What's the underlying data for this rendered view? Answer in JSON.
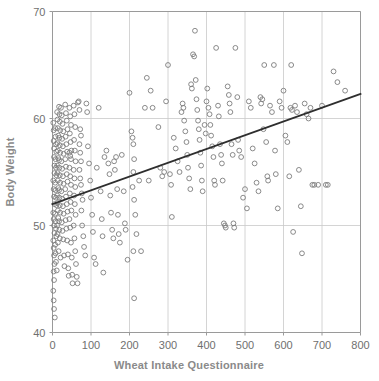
{
  "chart_data": {
    "type": "scatter",
    "title": "",
    "xlabel": "Wheat Intake Questionnaire",
    "ylabel": "Body Weight",
    "xlim": [
      0,
      800
    ],
    "ylim": [
      40,
      70
    ],
    "xticks": [
      0,
      100,
      200,
      300,
      400,
      500,
      600,
      700,
      800
    ],
    "yticks": [
      40,
      50,
      60,
      70
    ],
    "xtick_labels": [
      "0",
      "100",
      "200",
      "300",
      "400",
      "500",
      "600",
      "700",
      "800"
    ],
    "ytick_labels": [
      "40",
      "50",
      "60",
      "70"
    ],
    "grid": true,
    "legend": null,
    "marker": "open-circle",
    "marker_color": "#7d7d7d",
    "trendline": {
      "type": "linear",
      "color": "#2e2e2e",
      "x": [
        0,
        800
      ],
      "y": [
        52.0,
        62.3
      ]
    },
    "points": [
      [
        2,
        59.6
      ],
      [
        3,
        58.9
      ],
      [
        3,
        57.9
      ],
      [
        4,
        57.2
      ],
      [
        4,
        56.4
      ],
      [
        5,
        55.6
      ],
      [
        5,
        54.9
      ],
      [
        2,
        54.2
      ],
      [
        3,
        53.4
      ],
      [
        4,
        52.7
      ],
      [
        5,
        52.0
      ],
      [
        2,
        51.2
      ],
      [
        3,
        50.6
      ],
      [
        4,
        50.0
      ],
      [
        5,
        49.3
      ],
      [
        2,
        48.6
      ],
      [
        3,
        47.9
      ],
      [
        4,
        47.2
      ],
      [
        5,
        46.4
      ],
      [
        3,
        45.7
      ],
      [
        4,
        44.9
      ],
      [
        2,
        43.9
      ],
      [
        3,
        43.0
      ],
      [
        4,
        42.2
      ],
      [
        6,
        41.4
      ],
      [
        7,
        59.1
      ],
      [
        8,
        58.3
      ],
      [
        9,
        57.6
      ],
      [
        10,
        56.9
      ],
      [
        8,
        56.2
      ],
      [
        9,
        55.4
      ],
      [
        10,
        54.7
      ],
      [
        7,
        54.0
      ],
      [
        8,
        53.3
      ],
      [
        9,
        52.6
      ],
      [
        10,
        51.9
      ],
      [
        7,
        51.1
      ],
      [
        8,
        50.4
      ],
      [
        9,
        49.7
      ],
      [
        10,
        49.0
      ],
      [
        7,
        48.2
      ],
      [
        8,
        47.4
      ],
      [
        9,
        46.6
      ],
      [
        11,
        45.8
      ],
      [
        12,
        60.6
      ],
      [
        13,
        59.9
      ],
      [
        14,
        59.1
      ],
      [
        15,
        58.4
      ],
      [
        13,
        57.7
      ],
      [
        14,
        57.0
      ],
      [
        15,
        56.3
      ],
      [
        12,
        55.6
      ],
      [
        13,
        54.9
      ],
      [
        14,
        54.2
      ],
      [
        15,
        53.5
      ],
      [
        12,
        52.8
      ],
      [
        13,
        52.1
      ],
      [
        14,
        51.4
      ],
      [
        15,
        50.7
      ],
      [
        12,
        50.0
      ],
      [
        13,
        49.2
      ],
      [
        14,
        48.4
      ],
      [
        16,
        47.6
      ],
      [
        17,
        61.1
      ],
      [
        18,
        60.4
      ],
      [
        19,
        59.7
      ],
      [
        20,
        58.9
      ],
      [
        18,
        58.2
      ],
      [
        19,
        57.5
      ],
      [
        20,
        56.8
      ],
      [
        17,
        56.1
      ],
      [
        18,
        55.4
      ],
      [
        19,
        54.7
      ],
      [
        20,
        54.0
      ],
      [
        17,
        53.3
      ],
      [
        18,
        52.6
      ],
      [
        19,
        51.9
      ],
      [
        20,
        51.2
      ],
      [
        17,
        50.4
      ],
      [
        18,
        49.6
      ],
      [
        19,
        48.8
      ],
      [
        21,
        47.0
      ],
      [
        22,
        61.0
      ],
      [
        24,
        60.3
      ],
      [
        26,
        59.5
      ],
      [
        28,
        58.8
      ],
      [
        25,
        58.1
      ],
      [
        27,
        57.4
      ],
      [
        29,
        56.7
      ],
      [
        23,
        56.0
      ],
      [
        25,
        55.3
      ],
      [
        27,
        54.6
      ],
      [
        29,
        53.9
      ],
      [
        23,
        53.2
      ],
      [
        25,
        52.5
      ],
      [
        27,
        51.8
      ],
      [
        29,
        51.1
      ],
      [
        24,
        50.3
      ],
      [
        26,
        49.5
      ],
      [
        28,
        48.7
      ],
      [
        30,
        47.2
      ],
      [
        31,
        46.2
      ],
      [
        33,
        61.3
      ],
      [
        35,
        60.5
      ],
      [
        37,
        59.8
      ],
      [
        39,
        59.0
      ],
      [
        34,
        58.3
      ],
      [
        36,
        57.6
      ],
      [
        38,
        56.9
      ],
      [
        33,
        56.2
      ],
      [
        35,
        55.5
      ],
      [
        37,
        54.8
      ],
      [
        39,
        54.1
      ],
      [
        33,
        53.4
      ],
      [
        35,
        52.7
      ],
      [
        37,
        52.0
      ],
      [
        39,
        51.3
      ],
      [
        34,
        50.5
      ],
      [
        36,
        49.7
      ],
      [
        38,
        48.6
      ],
      [
        40,
        47.3
      ],
      [
        41,
        46.0
      ],
      [
        42,
        45.3
      ],
      [
        44,
        61.0
      ],
      [
        46,
        60.2
      ],
      [
        48,
        59.4
      ],
      [
        45,
        58.6
      ],
      [
        47,
        57.8
      ],
      [
        49,
        57.0
      ],
      [
        44,
        56.8
      ],
      [
        46,
        56.5
      ],
      [
        48,
        56.2
      ],
      [
        44,
        55.4
      ],
      [
        46,
        54.6
      ],
      [
        48,
        53.8
      ],
      [
        45,
        53.0
      ],
      [
        47,
        52.2
      ],
      [
        49,
        51.4
      ],
      [
        44,
        50.6
      ],
      [
        46,
        49.8
      ],
      [
        48,
        48.4
      ],
      [
        50,
        47.0
      ],
      [
        51,
        45.4
      ],
      [
        52,
        44.6
      ],
      [
        55,
        61.2
      ],
      [
        57,
        60.4
      ],
      [
        59,
        59.2
      ],
      [
        56,
        58.0
      ],
      [
        58,
        57.0
      ],
      [
        60,
        56.0
      ],
      [
        55,
        55.2
      ],
      [
        57,
        54.4
      ],
      [
        59,
        53.6
      ],
      [
        56,
        52.8
      ],
      [
        58,
        52.0
      ],
      [
        60,
        51.0
      ],
      [
        55,
        50.0
      ],
      [
        57,
        48.8
      ],
      [
        59,
        47.6
      ],
      [
        61,
        46.4
      ],
      [
        63,
        45.2
      ],
      [
        65,
        44.6
      ],
      [
        66,
        61.5
      ],
      [
        68,
        61.6
      ],
      [
        70,
        60.8
      ],
      [
        72,
        59.0
      ],
      [
        74,
        58.4
      ],
      [
        70,
        57.6
      ],
      [
        72,
        56.8
      ],
      [
        74,
        56.0
      ],
      [
        70,
        55.2
      ],
      [
        72,
        54.4
      ],
      [
        74,
        53.8
      ],
      [
        76,
        53.0
      ],
      [
        78,
        52.4
      ],
      [
        75,
        51.4
      ],
      [
        77,
        50.0
      ],
      [
        80,
        49.0
      ],
      [
        82,
        48.0
      ],
      [
        85,
        47.2
      ],
      [
        88,
        61.4
      ],
      [
        90,
        60.6
      ],
      [
        92,
        57.4
      ],
      [
        95,
        55.8
      ],
      [
        98,
        54.2
      ],
      [
        100,
        52.6
      ],
      [
        103,
        51.0
      ],
      [
        105,
        49.4
      ],
      [
        108,
        47.0
      ],
      [
        112,
        46.4
      ],
      [
        115,
        55.4
      ],
      [
        120,
        61.0
      ],
      [
        125,
        53.2
      ],
      [
        128,
        50.6
      ],
      [
        130,
        49.0
      ],
      [
        132,
        45.6
      ],
      [
        135,
        56.4
      ],
      [
        140,
        57.0
      ],
      [
        145,
        55.8
      ],
      [
        148,
        54.8
      ],
      [
        150,
        52.8
      ],
      [
        152,
        51.2
      ],
      [
        155,
        49.6
      ],
      [
        158,
        48.8
      ],
      [
        160,
        56.0
      ],
      [
        162,
        55.2
      ],
      [
        165,
        56.4
      ],
      [
        168,
        53.4
      ],
      [
        170,
        51.0
      ],
      [
        172,
        49.2
      ],
      [
        175,
        48.4
      ],
      [
        180,
        56.6
      ],
      [
        185,
        53.2
      ],
      [
        188,
        50.2
      ],
      [
        190,
        49.6
      ],
      [
        195,
        46.8
      ],
      [
        200,
        62.4
      ],
      [
        205,
        58.8
      ],
      [
        208,
        58.2
      ],
      [
        210,
        57.6
      ],
      [
        212,
        56.2
      ],
      [
        210,
        55.0
      ],
      [
        208,
        53.6
      ],
      [
        212,
        52.4
      ],
      [
        215,
        51.0
      ],
      [
        218,
        49.2
      ],
      [
        210,
        47.6
      ],
      [
        212,
        43.2
      ],
      [
        225,
        54.2
      ],
      [
        230,
        47.6
      ],
      [
        240,
        61.0
      ],
      [
        245,
        63.8
      ],
      [
        250,
        54.2
      ],
      [
        255,
        62.6
      ],
      [
        260,
        61.0
      ],
      [
        275,
        59.2
      ],
      [
        280,
        55.4
      ],
      [
        285,
        54.6
      ],
      [
        290,
        55.0
      ],
      [
        295,
        61.6
      ],
      [
        300,
        65.0
      ],
      [
        305,
        54.8
      ],
      [
        308,
        53.8
      ],
      [
        310,
        50.8
      ],
      [
        315,
        58.2
      ],
      [
        320,
        57.2
      ],
      [
        325,
        56.0
      ],
      [
        330,
        55.0
      ],
      [
        335,
        60.6
      ],
      [
        338,
        61.4
      ],
      [
        340,
        61.0
      ],
      [
        342,
        59.8
      ],
      [
        345,
        58.8
      ],
      [
        348,
        57.8
      ],
      [
        350,
        56.6
      ],
      [
        352,
        55.4
      ],
      [
        355,
        54.4
      ],
      [
        358,
        53.4
      ],
      [
        360,
        63.2
      ],
      [
        362,
        62.8
      ],
      [
        365,
        66.0
      ],
      [
        368,
        65.8
      ],
      [
        370,
        68.2
      ],
      [
        372,
        63.6
      ],
      [
        374,
        61.8
      ],
      [
        376,
        60.8
      ],
      [
        378,
        59.8
      ],
      [
        380,
        59.0
      ],
      [
        382,
        58.0
      ],
      [
        384,
        56.8
      ],
      [
        386,
        55.6
      ],
      [
        388,
        54.2
      ],
      [
        390,
        53.2
      ],
      [
        395,
        59.4
      ],
      [
        398,
        58.6
      ],
      [
        400,
        61.6
      ],
      [
        402,
        62.8
      ],
      [
        405,
        61.0
      ],
      [
        408,
        60.4
      ],
      [
        410,
        59.4
      ],
      [
        412,
        58.4
      ],
      [
        415,
        57.4
      ],
      [
        418,
        56.4
      ],
      [
        420,
        54.2
      ],
      [
        422,
        53.8
      ],
      [
        425,
        66.6
      ],
      [
        430,
        61.2
      ],
      [
        432,
        60.2
      ],
      [
        435,
        57.6
      ],
      [
        438,
        56.6
      ],
      [
        440,
        55.8
      ],
      [
        442,
        54.2
      ],
      [
        445,
        50.2
      ],
      [
        448,
        50.0
      ],
      [
        450,
        49.8
      ],
      [
        455,
        63.0
      ],
      [
        458,
        62.2
      ],
      [
        460,
        61.4
      ],
      [
        462,
        60.6
      ],
      [
        465,
        57.6
      ],
      [
        468,
        56.6
      ],
      [
        470,
        50.2
      ],
      [
        472,
        49.8
      ],
      [
        475,
        66.6
      ],
      [
        480,
        62.0
      ],
      [
        482,
        58.0
      ],
      [
        485,
        57.0
      ],
      [
        490,
        56.4
      ],
      [
        495,
        52.6
      ],
      [
        500,
        53.4
      ],
      [
        505,
        51.6
      ],
      [
        510,
        61.6
      ],
      [
        515,
        61.0
      ],
      [
        520,
        57.2
      ],
      [
        525,
        55.8
      ],
      [
        530,
        54.0
      ],
      [
        535,
        53.2
      ],
      [
        540,
        62.0
      ],
      [
        542,
        61.4
      ],
      [
        545,
        61.8
      ],
      [
        548,
        59.0
      ],
      [
        550,
        65.0
      ],
      [
        555,
        57.8
      ],
      [
        558,
        54.6
      ],
      [
        560,
        54.2
      ],
      [
        565,
        61.2
      ],
      [
        570,
        60.6
      ],
      [
        575,
        65.0
      ],
      [
        578,
        57.0
      ],
      [
        580,
        54.8
      ],
      [
        585,
        51.6
      ],
      [
        590,
        61.6
      ],
      [
        595,
        61.0
      ],
      [
        600,
        62.6
      ],
      [
        605,
        58.4
      ],
      [
        610,
        57.8
      ],
      [
        615,
        54.6
      ],
      [
        618,
        61.0
      ],
      [
        620,
        65.0
      ],
      [
        622,
        60.8
      ],
      [
        625,
        49.4
      ],
      [
        630,
        61.2
      ],
      [
        635,
        60.6
      ],
      [
        640,
        55.2
      ],
      [
        645,
        51.8
      ],
      [
        648,
        47.4
      ],
      [
        655,
        61.4
      ],
      [
        660,
        60.4
      ],
      [
        665,
        60.0
      ],
      [
        670,
        61.0
      ],
      [
        675,
        53.8
      ],
      [
        680,
        53.8
      ],
      [
        690,
        53.8
      ],
      [
        700,
        61.2
      ],
      [
        710,
        53.8
      ],
      [
        715,
        53.8
      ],
      [
        730,
        64.4
      ],
      [
        740,
        63.4
      ],
      [
        760,
        62.6
      ]
    ]
  },
  "axes": {
    "y_title": "Body Weight",
    "x_title": "Wheat Intake Questionnaire"
  }
}
